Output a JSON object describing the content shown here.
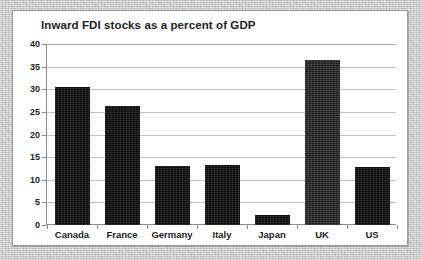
{
  "figure": {
    "frame_border_color": "#9a9a9a",
    "page_background_color": "#c8c8c8",
    "plot_background_color": "#ffffff"
  },
  "chart_data": {
    "type": "bar",
    "title": "Inward FDI stocks as a percent of GDP",
    "xlabel": "",
    "ylabel": "",
    "ylim": [
      0,
      40
    ],
    "yticks": [
      0,
      5,
      10,
      15,
      20,
      25,
      30,
      35,
      40
    ],
    "ytick_labels": [
      "0",
      "5",
      "10",
      "15",
      "20",
      "25",
      "30",
      "35",
      "40"
    ],
    "grid": "horizontal",
    "legend": "none",
    "categories": [
      "Canada",
      "France",
      "Germany",
      "Italy",
      "Japan",
      "UK",
      "US"
    ],
    "values": [
      30.5,
      26.4,
      13.0,
      13.2,
      2.3,
      36.5,
      12.8
    ],
    "bar_colors": [
      "#141414",
      "#141414",
      "#141414",
      "#141414",
      "#141414",
      "#333333",
      "#141414"
    ],
    "series": [
      {
        "name": "Inward FDI stocks as a percent of GDP",
        "values": [
          30.5,
          26.4,
          13.0,
          13.2,
          2.3,
          36.5,
          12.8
        ]
      }
    ]
  }
}
